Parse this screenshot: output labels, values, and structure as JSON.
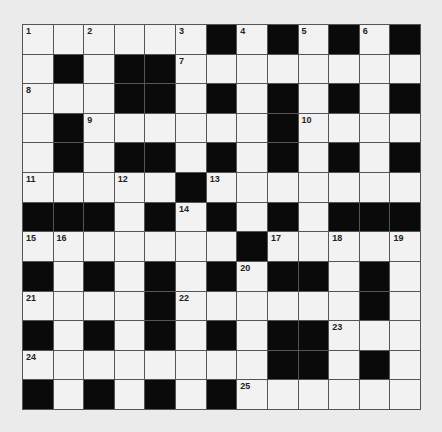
{
  "puzzle": {
    "rows": 13,
    "cols": 13,
    "grid": [
      "......#.#.#.#",
      ".#.##........",
      "...##.#.#.#.#",
      ".#......#....",
      ".#.##.#.#.#.#",
      ".....#.......",
      "###.#.#.#.###",
      ".......#.....",
      "#.#.#.#.##.#.",
      "....#......#.",
      "#.#.#.#.##...",
      "........##.#.",
      "#.#.#.#......"
    ],
    "numbers": [
      {
        "row": 0,
        "col": 0,
        "n": "1"
      },
      {
        "row": 0,
        "col": 2,
        "n": "2"
      },
      {
        "row": 0,
        "col": 5,
        "n": "3"
      },
      {
        "row": 0,
        "col": 7,
        "n": "4"
      },
      {
        "row": 0,
        "col": 9,
        "n": "5"
      },
      {
        "row": 0,
        "col": 11,
        "n": "6"
      },
      {
        "row": 1,
        "col": 5,
        "n": "7"
      },
      {
        "row": 2,
        "col": 0,
        "n": "8"
      },
      {
        "row": 3,
        "col": 2,
        "n": "9"
      },
      {
        "row": 3,
        "col": 9,
        "n": "10"
      },
      {
        "row": 5,
        "col": 0,
        "n": "11"
      },
      {
        "row": 5,
        "col": 3,
        "n": "12"
      },
      {
        "row": 5,
        "col": 6,
        "n": "13"
      },
      {
        "row": 6,
        "col": 5,
        "n": "14"
      },
      {
        "row": 7,
        "col": 0,
        "n": "15"
      },
      {
        "row": 7,
        "col": 1,
        "n": "16"
      },
      {
        "row": 7,
        "col": 8,
        "n": "17"
      },
      {
        "row": 7,
        "col": 10,
        "n": "18"
      },
      {
        "row": 7,
        "col": 12,
        "n": "19"
      },
      {
        "row": 8,
        "col": 7,
        "n": "20"
      },
      {
        "row": 9,
        "col": 0,
        "n": "21"
      },
      {
        "row": 9,
        "col": 5,
        "n": "22"
      },
      {
        "row": 10,
        "col": 10,
        "n": "23"
      },
      {
        "row": 11,
        "col": 0,
        "n": "24"
      },
      {
        "row": 12,
        "col": 7,
        "n": "25"
      }
    ]
  },
  "colors": {
    "block": "#0a0a0a",
    "cell": "#f2f2f2",
    "gridline": "#555555"
  }
}
